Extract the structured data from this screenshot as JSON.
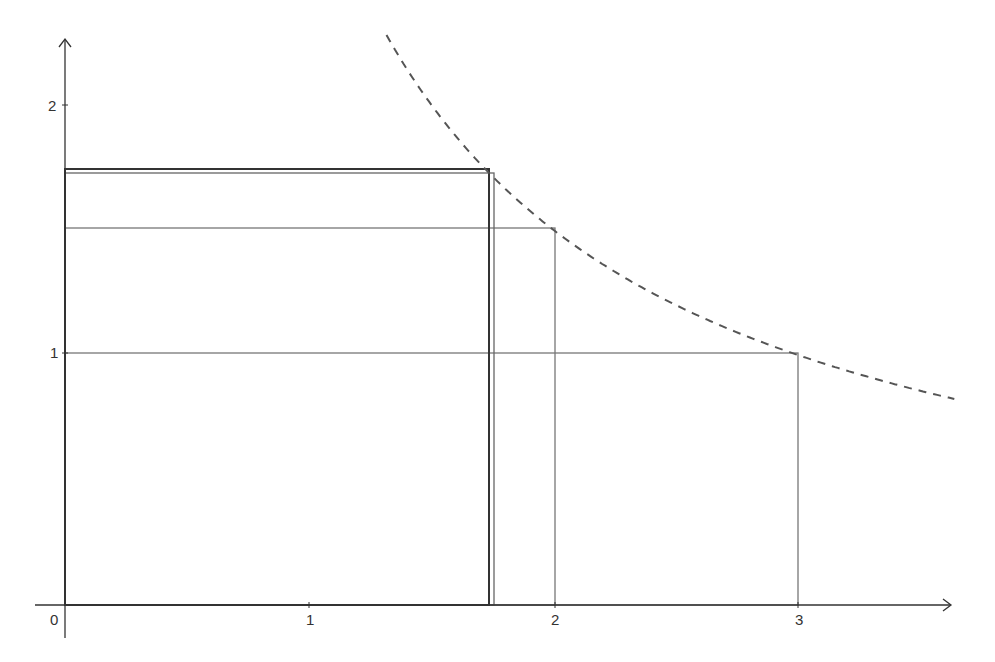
{
  "diagram": {
    "origin_label": "0",
    "x_axis": {
      "ticks": [
        {
          "value": 1,
          "label": "1"
        },
        {
          "value": 2,
          "label": "2"
        },
        {
          "value": 3,
          "label": "3"
        }
      ]
    },
    "y_axis": {
      "ticks": [
        {
          "value": 1,
          "label": "1"
        },
        {
          "value": 2,
          "label": "2"
        }
      ]
    },
    "curve": {
      "equation": "y = 3/x",
      "style": "dashed",
      "color": "#555555",
      "x_from": 1.316,
      "x_to": 3.64
    },
    "rectangles": [
      {
        "name": "square-sqrt3",
        "width": 1.732,
        "height": 1.732,
        "color": "#333333",
        "stroke_width": 2
      },
      {
        "name": "rect-1.75",
        "width": 1.75,
        "height": 1.714,
        "color": "#666666",
        "stroke_width": 1.3
      },
      {
        "name": "rect-2-by-1.5",
        "width": 2,
        "height": 1.5,
        "color": "#777777",
        "stroke_width": 1.3
      },
      {
        "name": "rect-3-by-1",
        "width": 3,
        "height": 1,
        "color": "#777777",
        "stroke_width": 1.3
      }
    ],
    "colors": {
      "axis": "#333333",
      "curve": "#555555",
      "background": "#ffffff"
    }
  }
}
